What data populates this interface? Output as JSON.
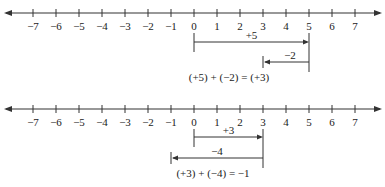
{
  "chart_data": {
    "type": "diagram",
    "number_lines": [
      {
        "id": "top",
        "range": [
          -7,
          7
        ],
        "tick_labels": [
          "−7",
          "−6",
          "−5",
          "−4",
          "−3",
          "−2",
          "−1",
          "0",
          "1",
          "2",
          "3",
          "4",
          "5",
          "6",
          "7"
        ],
        "arrows": [
          {
            "label": "+5",
            "from": 0,
            "to": 5,
            "direction": "right"
          },
          {
            "label": "−2",
            "from": 5,
            "to": 3,
            "direction": "left"
          }
        ],
        "equation": "(+5) + (−2) = (+3)"
      },
      {
        "id": "bottom",
        "range": [
          -7,
          7
        ],
        "tick_labels": [
          "−7",
          "−6",
          "−5",
          "−4",
          "−3",
          "−2",
          "−1",
          "0",
          "1",
          "2",
          "3",
          "4",
          "5",
          "6",
          "7"
        ],
        "arrows": [
          {
            "label": "+3",
            "from": 0,
            "to": 3,
            "direction": "right"
          },
          {
            "label": "−4",
            "from": 3,
            "to": -1,
            "direction": "left"
          }
        ],
        "equation": "(+3) + (−4) = −1"
      }
    ]
  },
  "colors": {
    "line": "#333333",
    "text": "#222222"
  }
}
